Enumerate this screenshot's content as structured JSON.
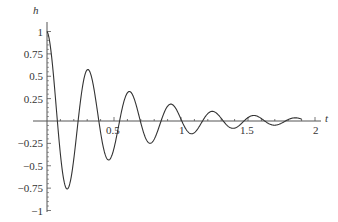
{
  "chart_data": {
    "type": "line",
    "title": "",
    "xlabel": "t",
    "ylabel": "h",
    "xlim": [
      0,
      2.0
    ],
    "ylim": [
      -1,
      1
    ],
    "grid": false,
    "legend": null,
    "x_ticks": [
      {
        "value": 0.5,
        "label": "0.5"
      },
      {
        "value": 1,
        "label": "1"
      },
      {
        "value": 1.5,
        "label": "1.5"
      },
      {
        "value": 2,
        "label": "2"
      }
    ],
    "x_minor_ticks": [
      0.1,
      0.2,
      0.3,
      0.4,
      0.6,
      0.7,
      0.8,
      0.9,
      1.1,
      1.2,
      1.3,
      1.4,
      1.6,
      1.7,
      1.8,
      1.9
    ],
    "y_ticks": [
      {
        "value": 1,
        "label": "1"
      },
      {
        "value": 0.75,
        "label": "0.75"
      },
      {
        "value": 0.5,
        "label": "0.5"
      },
      {
        "value": 0.25,
        "label": "0.25"
      },
      {
        "value": -0.25,
        "label": "-0.25"
      },
      {
        "value": -0.5,
        "label": "-0.5"
      },
      {
        "value": -0.75,
        "label": "-0.75"
      },
      {
        "value": -1,
        "label": "-1"
      }
    ],
    "function": {
      "form": "h = exp(-a t) cos(w t)",
      "a": 1.8,
      "w": 20.3,
      "t_range": [
        0,
        1.9
      ]
    },
    "series": [
      {
        "name": "h(t)",
        "x": [
          0,
          0.05,
          0.1,
          0.15,
          0.2,
          0.25,
          0.3,
          0.35,
          0.4,
          0.45,
          0.5,
          0.55,
          0.6,
          0.65,
          0.7,
          0.75,
          0.8,
          0.85,
          0.9,
          0.95,
          1.0,
          1.05,
          1.1,
          1.15,
          1.2,
          1.25,
          1.3,
          1.35,
          1.4,
          1.45,
          1.5,
          1.55,
          1.6,
          1.65,
          1.7,
          1.75,
          1.8,
          1.85,
          1.9
        ],
        "values": [
          1.0,
          0.49,
          -0.37,
          -0.74,
          -0.43,
          0.13,
          0.54,
          0.39,
          -0.07,
          -0.37,
          -0.28,
          0.09,
          0.29,
          0.17,
          -0.09,
          -0.21,
          -0.09,
          0.12,
          0.15,
          0.02,
          -0.1,
          -0.08,
          0.03,
          0.09,
          0.05,
          -0.04,
          -0.06,
          -0.01,
          0.05,
          0.04,
          -0.02,
          -0.04,
          0.0,
          0.03,
          0.02,
          -0.01,
          -0.02,
          0.0,
          0.02
        ]
      }
    ],
    "colors": {
      "line": "#333333",
      "axis": "#555555",
      "text": "#333333"
    }
  }
}
